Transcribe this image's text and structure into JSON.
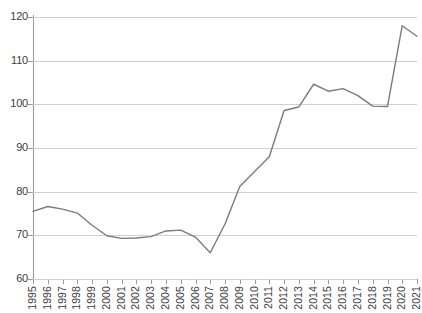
{
  "chart_data": {
    "type": "line",
    "title": "",
    "subtitle": "",
    "xlabel": "",
    "ylabel": "",
    "categories": [
      "1995",
      "1996",
      "1997",
      "1998",
      "1999",
      "2000",
      "2001",
      "2002",
      "2003",
      "2004",
      "2005",
      "2006",
      "2007",
      "2008",
      "2009",
      "2010",
      "2011",
      "2012",
      "2013",
      "2014",
      "2015",
      "2016",
      "2017",
      "2018",
      "2019",
      "2020",
      "2021"
    ],
    "x": [
      1995,
      1996,
      1997,
      1998,
      1999,
      2000,
      2001,
      2002,
      2003,
      2004,
      2005,
      2006,
      2007,
      2008,
      2009,
      2010,
      2011,
      2012,
      2013,
      2014,
      2015,
      2016,
      2017,
      2018,
      2019,
      2020,
      2021
    ],
    "values": [
      75.5,
      76.6,
      76.0,
      75.1,
      72.3,
      69.9,
      69.3,
      69.4,
      69.7,
      71.0,
      71.2,
      69.6,
      66.0,
      72.6,
      81.2,
      84.6,
      88.0,
      98.6,
      99.4,
      104.6,
      103.0,
      103.6,
      102.0,
      99.6,
      99.5,
      118.0,
      115.6
    ],
    "series": [
      {
        "name": "",
        "values": [
          75.5,
          76.6,
          76.0,
          75.1,
          72.3,
          69.9,
          69.3,
          69.4,
          69.7,
          71.0,
          71.2,
          69.6,
          66.0,
          72.6,
          81.2,
          84.6,
          88.0,
          98.6,
          99.4,
          104.6,
          103.0,
          103.6,
          102.0,
          99.6,
          99.5,
          118.0,
          115.6
        ],
        "color": "#7b7b7b"
      }
    ],
    "ylim": [
      60,
      120
    ],
    "yticks": [
      60,
      70,
      80,
      90,
      100,
      110,
      120
    ],
    "ytick_labels": [
      "60",
      "70",
      "80",
      "90",
      "100",
      "110",
      "120"
    ],
    "xlim": [
      1995,
      2021
    ],
    "grid": "horizontal",
    "legend": "none",
    "markers": "none",
    "line_width": 1.4,
    "annotations": []
  },
  "style": {
    "background": "#ffffff",
    "grid_color": "#d0d0d0",
    "axis_color": "#9a9a9a",
    "line_color": "#7b7b7b",
    "tick_text_color": "#3c3c3c"
  }
}
